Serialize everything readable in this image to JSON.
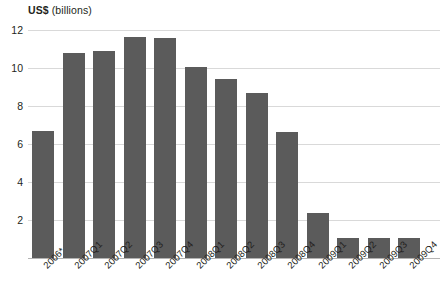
{
  "chart_data": {
    "type": "bar",
    "title": "US$ (billions)",
    "title_parts": {
      "unit": "US$",
      "paren": " (billions)"
    },
    "xlabel": "",
    "ylabel": "US$ (billions)",
    "ylim": [
      0,
      12
    ],
    "yticks": [
      12,
      10,
      8,
      6,
      4,
      2
    ],
    "grid": true,
    "legend": "none",
    "bar_color": "#5b5b5b",
    "grid_color": "#d9d9d9",
    "text_color": "#231f20",
    "categories": [
      "2006*",
      "2007Q1",
      "2007Q2",
      "2007Q3",
      "2007Q4",
      "2008Q1",
      "2008Q2",
      "2008Q3",
      "2008Q4",
      "2009Q1",
      "2009Q2",
      "2009Q3",
      "2009Q4"
    ],
    "values": [
      6.7,
      10.8,
      10.9,
      11.65,
      11.6,
      10.05,
      9.4,
      8.7,
      6.65,
      2.35,
      1.05,
      1.05,
      1.05
    ],
    "annotations": [
      "* 2006 is an annual figure"
    ]
  }
}
